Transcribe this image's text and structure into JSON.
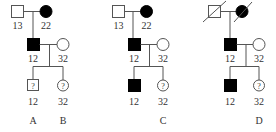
{
  "panels": [
    {
      "id": "AB",
      "labels": [
        "A",
        "B"
      ],
      "parents": {
        "father": {
          "genotype": "13",
          "affected": false,
          "deceased": false
        },
        "mother": {
          "genotype": "22",
          "affected": true,
          "deceased": false
        }
      },
      "proband": {
        "genotype": "12",
        "affected": true,
        "sex": "male"
      },
      "spouse": {
        "genotype": "32",
        "affected": false,
        "sex": "female"
      },
      "children": [
        {
          "genotype": "12",
          "sex": "male",
          "status": "?"
        },
        {
          "genotype": "32",
          "sex": "female",
          "status": "?"
        }
      ]
    },
    {
      "id": "C",
      "labels": [
        "C"
      ],
      "parents": {
        "father": {
          "genotype": "13",
          "affected": false,
          "deceased": false
        },
        "mother": {
          "genotype": "22",
          "affected": true,
          "deceased": false
        }
      },
      "proband": {
        "genotype": "12",
        "affected": true,
        "sex": "male"
      },
      "spouse": {
        "genotype": "32",
        "affected": false,
        "sex": "female"
      },
      "children": [
        {
          "genotype": "12",
          "sex": "male",
          "status": "affected"
        },
        {
          "genotype": "32",
          "sex": "female",
          "status": "?"
        }
      ]
    },
    {
      "id": "D",
      "labels": [
        "D"
      ],
      "parents": {
        "father": {
          "genotype": "",
          "affected": false,
          "deceased": true
        },
        "mother": {
          "genotype": "",
          "affected": true,
          "deceased": true
        }
      },
      "proband": {
        "genotype": "12",
        "affected": true,
        "sex": "male"
      },
      "spouse": {
        "genotype": "32",
        "affected": false,
        "sex": "female"
      },
      "children": [
        {
          "genotype": "12",
          "sex": "male",
          "status": "affected"
        },
        {
          "genotype": "32",
          "sex": "female",
          "status": "?"
        }
      ]
    }
  ],
  "text": {
    "p1": {
      "f": "13",
      "m": "22",
      "s": "12",
      "w": "32",
      "c1": "12",
      "c2": "32",
      "q1": "?",
      "q2": "?",
      "la": "A",
      "lb": "B"
    },
    "p2": {
      "f": "13",
      "m": "22",
      "s": "12",
      "w": "32",
      "c1": "12",
      "c2": "32",
      "q2": "?",
      "lc": "C"
    },
    "p3": {
      "s": "12",
      "w": "32",
      "c1": "12",
      "c2": "32",
      "q2": "?",
      "ld": "D"
    }
  },
  "colors": {
    "line": "#555555",
    "fill": "#000000"
  }
}
